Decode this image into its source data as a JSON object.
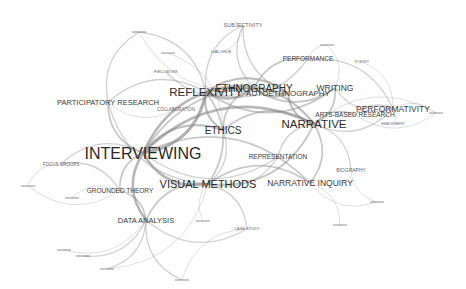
{
  "diagram": {
    "type": "keyword co-occurrence network",
    "background": "#ffffff",
    "edge_color": "#888888",
    "label_color": "#2a2a2a",
    "nodes": [
      {
        "id": "interviewing",
        "label": "INTERVIEWING",
        "x": 143,
        "y": 153,
        "size": 16
      },
      {
        "id": "reflexivity",
        "label": "REFLEXIVITY",
        "x": 206,
        "y": 92,
        "size": 11.5
      },
      {
        "id": "narrative",
        "label": "NARRATIVE",
        "x": 314,
        "y": 124,
        "size": 11.5
      },
      {
        "id": "visual_methods",
        "label": "VISUAL METHODS",
        "x": 208,
        "y": 184,
        "size": 11
      },
      {
        "id": "ethnography",
        "label": "ETHNOGRAPHY",
        "x": 254,
        "y": 88,
        "size": 10
      },
      {
        "id": "autoethnography",
        "label": "AUTOETHNOGRAPHY",
        "x": 288,
        "y": 93,
        "size": 8
      },
      {
        "id": "ethics",
        "label": "ETHICS",
        "x": 223,
        "y": 130,
        "size": 10
      },
      {
        "id": "narrative_inquiry",
        "label": "NARRATIVE INQUIRY",
        "x": 310,
        "y": 183,
        "size": 8.5
      },
      {
        "id": "performativity",
        "label": "PERFORMATIVITY",
        "x": 393,
        "y": 109,
        "size": 8.5
      },
      {
        "id": "writing",
        "label": "WRITING",
        "x": 335,
        "y": 88,
        "size": 8.5
      },
      {
        "id": "arts_based_research",
        "label": "ARTS-BASED RESEARCH",
        "x": 355,
        "y": 115,
        "size": 6.5
      },
      {
        "id": "participatory_research",
        "label": "PARTICIPATORY RESEARCH",
        "x": 108,
        "y": 102,
        "size": 7.5
      },
      {
        "id": "representation",
        "label": "REPRESENTATION",
        "x": 278,
        "y": 157,
        "size": 6.5
      },
      {
        "id": "data_analysis",
        "label": "DATA ANALYSIS",
        "x": 146,
        "y": 220,
        "size": 7.5
      },
      {
        "id": "grounded_theory",
        "label": "GROUNDED THEORY",
        "x": 120,
        "y": 191,
        "size": 6.5
      },
      {
        "id": "performance",
        "label": "PERFORMANCE",
        "x": 308,
        "y": 59,
        "size": 6.5
      },
      {
        "id": "subjectivity",
        "label": "SUBJECTIVITY",
        "x": 243,
        "y": 25,
        "size": 5.5
      },
      {
        "id": "biography",
        "label": "BIOGRAPHY",
        "x": 351,
        "y": 170,
        "size": 5
      },
      {
        "id": "focus_groups",
        "label": "FOCUS GROUPS",
        "x": 61,
        "y": 164,
        "size": 4.5
      },
      {
        "id": "collaboration",
        "label": "COLLABORATION",
        "x": 176,
        "y": 109,
        "size": 4.5
      },
      {
        "id": "fieldwork",
        "label": "FIELDWORK",
        "x": 166,
        "y": 72,
        "size": 4
      },
      {
        "id": "dialogue",
        "label": "DIALOGUE",
        "x": 221,
        "y": 52,
        "size": 4
      },
      {
        "id": "poetry",
        "label": "POETRY",
        "x": 362,
        "y": 62,
        "size": 3.5
      },
      {
        "id": "embodiment",
        "label": "EMBODIMENT",
        "x": 393,
        "y": 124,
        "size": 3.5
      },
      {
        "id": "case_study",
        "label": "CASE STUDY",
        "x": 247,
        "y": 229,
        "size": 4
      },
      {
        "id": "small_top_left",
        "label": "",
        "x": 139,
        "y": 32,
        "size": 2
      },
      {
        "id": "small_top_mid",
        "label": "",
        "x": 168,
        "y": 53,
        "size": 2
      },
      {
        "id": "small_top_right",
        "label": "",
        "x": 327,
        "y": 45,
        "size": 2
      },
      {
        "id": "small_right",
        "label": "",
        "x": 436,
        "y": 113,
        "size": 2
      },
      {
        "id": "small_left_1",
        "label": "",
        "x": 28,
        "y": 186,
        "size": 2
      },
      {
        "id": "small_left_2",
        "label": "",
        "x": 72,
        "y": 198,
        "size": 2
      },
      {
        "id": "small_left_3",
        "label": "",
        "x": 83,
        "y": 256,
        "size": 2
      },
      {
        "id": "small_bottom_right_1",
        "label": "",
        "x": 377,
        "y": 202,
        "size": 2
      },
      {
        "id": "small_bottom_right_2",
        "label": "",
        "x": 340,
        "y": 225,
        "size": 2
      },
      {
        "id": "small_bottom_1",
        "label": "",
        "x": 107,
        "y": 269,
        "size": 2
      },
      {
        "id": "small_bottom_2",
        "label": "",
        "x": 182,
        "y": 280,
        "size": 2
      },
      {
        "id": "small_bottom_3",
        "label": "",
        "x": 203,
        "y": 221,
        "size": 2
      },
      {
        "id": "small_mid",
        "label": "",
        "x": 64,
        "y": 250,
        "size": 2
      }
    ],
    "edges": [
      [
        "interviewing",
        "reflexivity",
        6
      ],
      [
        "interviewing",
        "narrative",
        5
      ],
      [
        "interviewing",
        "visual_methods",
        5
      ],
      [
        "interviewing",
        "ethics",
        4
      ],
      [
        "interviewing",
        "data_analysis",
        5
      ],
      [
        "interviewing",
        "ethnography",
        5
      ],
      [
        "interviewing",
        "grounded_theory",
        3
      ],
      [
        "interviewing",
        "participatory_research",
        3
      ],
      [
        "interviewing",
        "focus_groups",
        2
      ],
      [
        "interviewing",
        "narrative_inquiry",
        3
      ],
      [
        "interviewing",
        "representation",
        2
      ],
      [
        "interviewing",
        "autoethnography",
        3
      ],
      [
        "reflexivity",
        "ethnography",
        5
      ],
      [
        "reflexivity",
        "narrative",
        4
      ],
      [
        "reflexivity",
        "ethics",
        4
      ],
      [
        "reflexivity",
        "autoethnography",
        4
      ],
      [
        "reflexivity",
        "writing",
        3
      ],
      [
        "reflexivity",
        "subjectivity",
        2
      ],
      [
        "reflexivity",
        "participatory_research",
        2
      ],
      [
        "reflexivity",
        "visual_methods",
        3
      ],
      [
        "reflexivity",
        "performance",
        2
      ],
      [
        "narrative",
        "autoethnography",
        4
      ],
      [
        "narrative",
        "writing",
        3
      ],
      [
        "narrative",
        "narrative_inquiry",
        3
      ],
      [
        "narrative",
        "performativity",
        2
      ],
      [
        "narrative",
        "arts_based_research",
        3
      ],
      [
        "narrative",
        "ethics",
        3
      ],
      [
        "narrative",
        "visual_methods",
        3
      ],
      [
        "narrative",
        "representation",
        2
      ],
      [
        "narrative",
        "biography",
        2
      ],
      [
        "ethnography",
        "writing",
        3
      ],
      [
        "ethnography",
        "performance",
        3
      ],
      [
        "ethnography",
        "autoethnography",
        4
      ],
      [
        "ethnography",
        "fieldwork",
        2
      ],
      [
        "ethnography",
        "ethics",
        3
      ],
      [
        "ethnography",
        "subjectivity",
        2
      ],
      [
        "visual_methods",
        "data_analysis",
        3
      ],
      [
        "visual_methods",
        "narrative_inquiry",
        3
      ],
      [
        "visual_methods",
        "representation",
        2
      ],
      [
        "visual_methods",
        "participatory_research",
        2
      ],
      [
        "visual_methods",
        "ethics",
        2
      ],
      [
        "visual_methods",
        "case_study",
        2
      ],
      [
        "performativity",
        "performance",
        2
      ],
      [
        "performativity",
        "writing",
        2
      ],
      [
        "performativity",
        "poetry",
        1
      ],
      [
        "performativity",
        "embodiment",
        1
      ],
      [
        "performativity",
        "arts_based_research",
        2
      ],
      [
        "performativity",
        "small_right",
        1
      ],
      [
        "data_analysis",
        "grounded_theory",
        3
      ],
      [
        "data_analysis",
        "small_bottom_1",
        2
      ],
      [
        "data_analysis",
        "small_bottom_2",
        2
      ],
      [
        "data_analysis",
        "small_left_3",
        2
      ],
      [
        "data_analysis",
        "case_study",
        2
      ],
      [
        "data_analysis",
        "small_mid",
        1
      ],
      [
        "grounded_theory",
        "focus_groups",
        2
      ],
      [
        "grounded_theory",
        "small_left_1",
        1
      ],
      [
        "grounded_theory",
        "small_left_2",
        1
      ],
      [
        "participatory_research",
        "small_top_left",
        2
      ],
      [
        "participatory_research",
        "collaboration",
        1
      ],
      [
        "subjectivity",
        "dialogue",
        1
      ],
      [
        "subjectivity",
        "autoethnography",
        2
      ],
      [
        "small_top_left",
        "reflexivity",
        2
      ],
      [
        "small_top_left",
        "ethnography",
        1
      ],
      [
        "small_top_mid",
        "ethics",
        1
      ],
      [
        "small_top_right",
        "performance",
        1
      ],
      [
        "small_top_right",
        "writing",
        1
      ],
      [
        "biography",
        "small_bottom_right_1",
        1
      ],
      [
        "narrative_inquiry",
        "small_bottom_right_2",
        1
      ],
      [
        "narrative_inquiry",
        "small_bottom_right_1",
        1
      ],
      [
        "small_right",
        "arts_based_research",
        1
      ],
      [
        "small_right",
        "narrative",
        1
      ],
      [
        "small_bottom_3",
        "visual_methods",
        1
      ],
      [
        "focus_groups",
        "small_left_1",
        1
      ],
      [
        "small_bottom_2",
        "case_study",
        1
      ],
      [
        "small_bottom_1",
        "visual_methods",
        1
      ]
    ]
  }
}
